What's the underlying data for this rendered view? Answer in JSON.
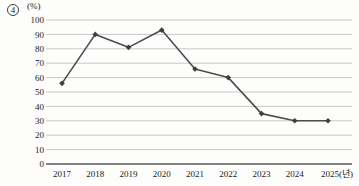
{
  "header": {
    "item_number": "4"
  },
  "chart_data": {
    "type": "line",
    "title": "",
    "ylabel": "(%)",
    "xlabel": "",
    "categories": [
      "2017",
      "2018",
      "2019",
      "2020",
      "2021",
      "2022",
      "2023",
      "2024",
      "2025(년)"
    ],
    "values": [
      56,
      90,
      81,
      93,
      66,
      60,
      35,
      30,
      30
    ],
    "ylim": [
      0,
      100
    ],
    "ytick_step": 10,
    "yticks": [
      0,
      10,
      20,
      30,
      40,
      50,
      60,
      70,
      80,
      90,
      100
    ],
    "grid": true,
    "legend": "none",
    "marker": "diamond",
    "line_color": "#4d4d4d",
    "marker_color": "#3f3f3f",
    "grid_color": "#c9c9c9",
    "axis_color": "#5a5a5a",
    "text_color": "#1b1b1b"
  }
}
